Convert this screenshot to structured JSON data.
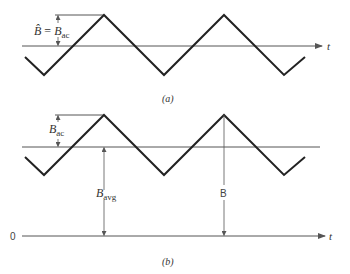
{
  "figure_a": {
    "caption": "(a)",
    "axis_label": "t",
    "amplitude_label_lhs": "B̂",
    "amplitude_label_eq": " = ",
    "amplitude_label_rhs_main": "B",
    "amplitude_label_rhs_sub": "ac",
    "waveform": "triangular",
    "waveform_points": [
      [
        25,
        57
      ],
      [
        44,
        75
      ],
      [
        104,
        15
      ],
      [
        164,
        75
      ],
      [
        224,
        15
      ],
      [
        284,
        75
      ],
      [
        305,
        57
      ]
    ]
  },
  "figure_b": {
    "caption": "(b)",
    "axis_label": "t",
    "zero_label": "0",
    "ac_label_main": "B",
    "ac_label_sub": "ac",
    "avg_label_main": "B",
    "avg_label_sub": "avg",
    "total_label": "B",
    "waveform": "triangular",
    "waveform_points": [
      [
        25,
        157
      ],
      [
        44,
        175
      ],
      [
        104,
        115
      ],
      [
        164,
        175
      ],
      [
        224,
        115
      ],
      [
        284,
        175
      ],
      [
        305,
        157
      ]
    ]
  },
  "colors": {
    "waveform": "#222222",
    "axis": "#555555",
    "text": "#333333"
  }
}
